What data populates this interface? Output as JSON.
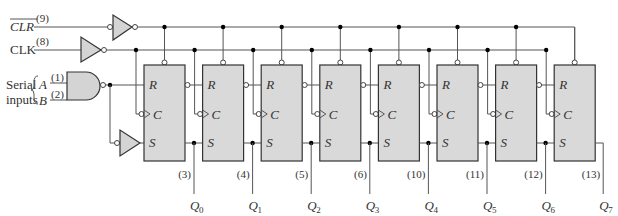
{
  "diagram": {
    "type": "8-bit serial-in parallel-out shift register (74HC164-style logic diagram)",
    "inputs": {
      "clr": {
        "label": "CLR",
        "overbar": true,
        "pin": "(9)"
      },
      "clk": {
        "label": "CLK",
        "pin": "(8)"
      },
      "serial_label_line1": "Serial",
      "serial_label_line2": "inputs",
      "a": {
        "label": "A",
        "pin": "(1)"
      },
      "b": {
        "label": "B",
        "pin": "(2)"
      }
    },
    "flip_flop_labels": {
      "r": "R",
      "c": "C",
      "s": "S"
    },
    "outputs": [
      {
        "name": "Q",
        "sub": "0",
        "pin": "(3)"
      },
      {
        "name": "Q",
        "sub": "1",
        "pin": "(4)"
      },
      {
        "name": "Q",
        "sub": "2",
        "pin": "(5)"
      },
      {
        "name": "Q",
        "sub": "3",
        "pin": "(6)"
      },
      {
        "name": "Q",
        "sub": "4",
        "pin": "(10)"
      },
      {
        "name": "Q",
        "sub": "5",
        "pin": "(11)"
      },
      {
        "name": "Q",
        "sub": "6",
        "pin": "(12)"
      },
      {
        "name": "Q",
        "sub": "7",
        "pin": "(13)"
      }
    ],
    "colors": {
      "box_fill": "#d9d9d9",
      "wire": "#555555",
      "background": "#ffffff"
    }
  }
}
